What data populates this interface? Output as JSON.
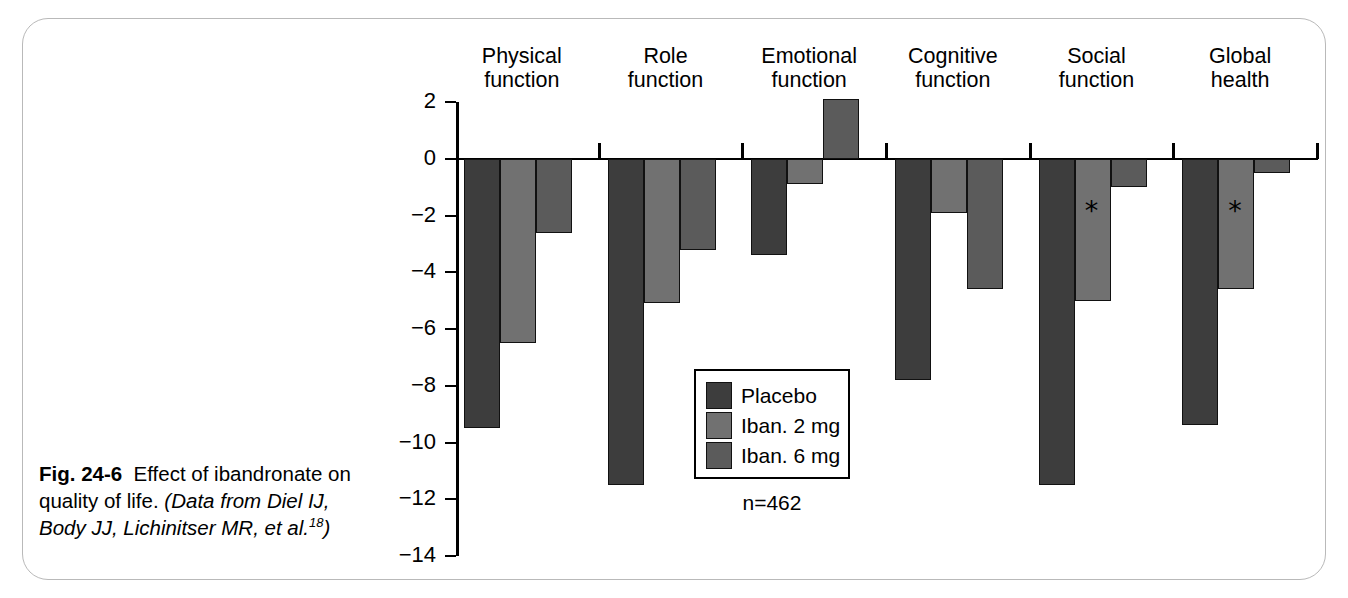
{
  "figure": {
    "caption_label": "Fig. 24-6",
    "caption_text": "Effect of ibandronate on quality of life.",
    "caption_source_open": "(Data from Diel IJ, Body JJ, Lichinitser MR, et al.",
    "caption_ref": "18",
    "caption_source_close": ")",
    "sample_note": "n=462"
  },
  "chart_data": {
    "type": "bar",
    "title": "",
    "subtitle": "",
    "xlabel": "",
    "ylabel": "",
    "orientation": "vertical",
    "grouping": "grouped",
    "grid": false,
    "legend_position": "inside-center",
    "ylim": [
      -14,
      2
    ],
    "ytick_step": 2,
    "ytick_labels": [
      "2",
      "0",
      "−2",
      "−4",
      "−6",
      "−8",
      "−10",
      "−12",
      "−14"
    ],
    "ytick_values": [
      2,
      0,
      -2,
      -4,
      -6,
      -8,
      -10,
      -12,
      -14
    ],
    "categories": [
      "Physical\nfunction",
      "Role\nfunction",
      "Emotional\nfunction",
      "Cognitive\nfunction",
      "Social\nfunction",
      "Global\nhealth"
    ],
    "category_lines": [
      [
        "Physical",
        "function"
      ],
      [
        "Role",
        "function"
      ],
      [
        "Emotional",
        "function"
      ],
      [
        "Cognitive",
        "function"
      ],
      [
        "Social",
        "function"
      ],
      [
        "Global",
        "health"
      ]
    ],
    "series": [
      {
        "name": "Placebo",
        "color": "#3d3d3d",
        "values": [
          -9.5,
          -11.5,
          -3.4,
          -7.8,
          -11.5,
          -9.4
        ]
      },
      {
        "name": "Iban. 2 mg",
        "color": "#717171",
        "values": [
          -6.5,
          -5.1,
          -0.9,
          -1.9,
          -5.0,
          -4.6
        ]
      },
      {
        "name": "Iban. 6 mg",
        "color": "#5b5b5b",
        "values": [
          -2.6,
          -3.2,
          2.1,
          -4.6,
          -1.0,
          -0.5
        ]
      }
    ],
    "annotations": [
      {
        "symbol": "*",
        "category": "Social function",
        "series": "Iban. 2 mg",
        "meaning": "significant"
      },
      {
        "symbol": "*",
        "category": "Global health",
        "series": "Iban. 2 mg",
        "meaning": "significant"
      }
    ],
    "legend_entries": [
      "Placebo",
      "Iban. 2 mg",
      "Iban. 6 mg"
    ]
  }
}
